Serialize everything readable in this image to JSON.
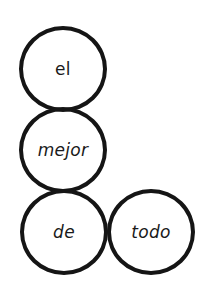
{
  "diagram": {
    "circles": [
      {
        "id": "c1",
        "label": "el",
        "cx": 63,
        "cy": 68
      },
      {
        "id": "c2",
        "label": "mejor",
        "cx": 63,
        "cy": 149
      },
      {
        "id": "c3",
        "label": "de",
        "cx": 64,
        "cy": 231
      },
      {
        "id": "c4",
        "label": "todo",
        "cx": 151,
        "cy": 231
      }
    ],
    "stroke_color": "#151515",
    "background": "#ffffff"
  }
}
